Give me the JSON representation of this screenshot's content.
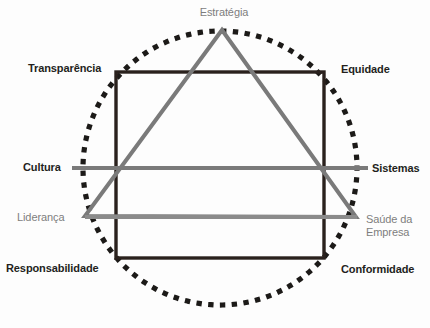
{
  "diagram": {
    "colors": {
      "dark": "#231f1c",
      "gray": "#7d7d7d",
      "line_gray": "#7a7a7a",
      "background": "#fdfdfd"
    },
    "shapes": {
      "circle": {
        "name": "dotted-circle",
        "cx": 220,
        "cy": 168,
        "r": 137,
        "style": "dotted"
      },
      "square": {
        "name": "square",
        "x1": 116,
        "y1": 72,
        "x2": 324,
        "y2": 258,
        "style": "solid-dark"
      },
      "triangle": {
        "name": "triangle",
        "apex": {
          "x": 222,
          "y": 30
        },
        "left": {
          "x": 85,
          "y": 216
        },
        "right": {
          "x": 356,
          "y": 217
        },
        "style": "solid-gray"
      },
      "line_horizontal_upper": {
        "name": "cultura-sistemas-line",
        "x1": 72,
        "y1": 168,
        "x2": 368,
        "y2": 168
      },
      "line_horizontal_lower": {
        "name": "lideranca-saude-line",
        "x1": 85,
        "y1": 217,
        "x2": 357,
        "y2": 217
      }
    },
    "labels": {
      "estrategia": "Estratégia",
      "transparencia": "Transparência",
      "equidade": "Equidade",
      "cultura": "Cultura",
      "sistemas": "Sistemas",
      "lideranca": "Liderança",
      "saude_empresa_line1": "Saúde da",
      "saude_empresa_line2": "Empresa",
      "responsabilidade": "Responsabilidade",
      "conformidade": "Conformidade"
    }
  }
}
